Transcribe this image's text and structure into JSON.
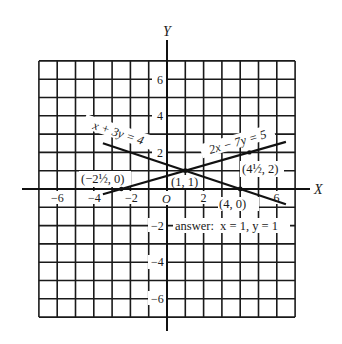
{
  "figure": {
    "axis_labels": {
      "x": "X",
      "y": "Y"
    },
    "origin_label": "O",
    "x_tick_labels": [
      {
        "value": -6,
        "label": "−6"
      },
      {
        "value": -4,
        "label": "−4"
      },
      {
        "value": -2,
        "label": "−2"
      },
      {
        "value": 2,
        "label": "2"
      },
      {
        "value": 6,
        "label": "6"
      }
    ],
    "y_tick_labels": [
      {
        "value": 6,
        "label": "6"
      },
      {
        "value": 4,
        "label": "4"
      },
      {
        "value": 2,
        "label": "2"
      },
      {
        "value": -2,
        "label": "−2"
      },
      {
        "value": -4,
        "label": "−4"
      },
      {
        "value": -6,
        "label": "−6"
      }
    ],
    "grid": {
      "x_range": [
        -7,
        7
      ],
      "y_range": [
        -7,
        7
      ],
      "step": 1
    },
    "lines": [
      {
        "equation": "x + 3y = 4",
        "from": [
          -3.5,
          2.5
        ],
        "to": [
          6.5,
          -0.83
        ],
        "label_text": "x + 3y = 4"
      },
      {
        "equation": "2x − 7y = 5",
        "from": [
          -3.5,
          -0.29
        ],
        "to": [
          6.5,
          2.57
        ],
        "label_text": "2x − 7y = 5"
      }
    ],
    "points": [
      {
        "x": -2.5,
        "y": 0,
        "label": "(−2½, 0)"
      },
      {
        "x": 1,
        "y": 1,
        "label": "(1, 1)"
      },
      {
        "x": 4,
        "y": 0,
        "label": "(4, 0)"
      },
      {
        "x": 4.5,
        "y": 2,
        "label": "(4½, 2)"
      }
    ],
    "answer": "answer:  x = 1, y = 1"
  }
}
